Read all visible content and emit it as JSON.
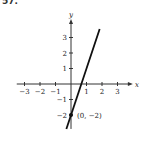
{
  "problem_label": "57.",
  "chart_data": {
    "type": "line",
    "title": "",
    "xlabel": "x",
    "ylabel": "y",
    "xlim": [
      -3.5,
      3.8
    ],
    "ylim": [
      -2.9,
      4.0
    ],
    "x_ticks": [
      -3,
      -2,
      -1,
      1,
      2,
      3
    ],
    "y_ticks": [
      -2,
      -1,
      1,
      2,
      3
    ],
    "x_tick_labels": [
      "−3",
      "−2",
      "−1",
      "1",
      "2",
      "3"
    ],
    "y_tick_labels": [
      "−2",
      "−1",
      "1",
      "2",
      "3"
    ],
    "grid": false,
    "series": [
      {
        "name": "y = 3x − 2",
        "x": [
          -0.3,
          1.85
        ],
        "y": [
          -2.9,
          3.55
        ]
      }
    ],
    "annotations": [
      {
        "text": "(0, −2)",
        "x": 0,
        "y": -2,
        "point": true
      }
    ]
  }
}
